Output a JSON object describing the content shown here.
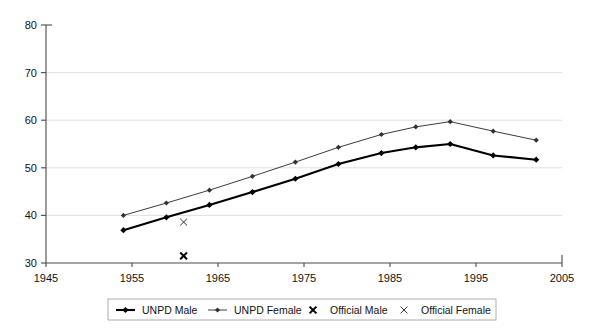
{
  "chart_data": {
    "type": "line",
    "title": "",
    "xlabel": "",
    "ylabel": "",
    "xlim": [
      1945,
      2005
    ],
    "ylim": [
      30,
      80
    ],
    "xticks": [
      1945,
      1955,
      1965,
      1975,
      1985,
      1995,
      2005
    ],
    "yticks": [
      30,
      40,
      50,
      60,
      70,
      80
    ],
    "grid": "horizontal",
    "legend_position": "bottom",
    "x": [
      1954,
      1959,
      1964,
      1969,
      1974,
      1979,
      1984,
      1988,
      1992,
      1997,
      2002
    ],
    "series": [
      {
        "name": "UNPD Male",
        "style": "line-diamond-bold",
        "color": "#000000",
        "values": [
          36.9,
          39.6,
          42.2,
          44.9,
          47.7,
          50.8,
          53.1,
          54.3,
          55.0,
          52.6,
          51.7
        ]
      },
      {
        "name": "UNPD Female",
        "style": "line-diamond-thin",
        "color": "#303030",
        "values": [
          40.0,
          42.6,
          45.3,
          48.2,
          51.2,
          54.3,
          57.0,
          58.6,
          59.7,
          57.7,
          55.8
        ]
      },
      {
        "name": "Official Male",
        "style": "x-marker-bold",
        "color": "#000000",
        "points": [
          {
            "x": 1961,
            "y": 31.5
          }
        ]
      },
      {
        "name": "Official Female",
        "style": "x-marker-thin",
        "color": "#303030",
        "points": [
          {
            "x": 1961,
            "y": 38.6
          }
        ]
      }
    ]
  },
  "axes": {
    "y_tick_labels": [
      "80",
      "70",
      "60",
      "50",
      "40",
      "30"
    ],
    "x_tick_labels": [
      "1945",
      "1955",
      "1965",
      "1975",
      "1985",
      "1995",
      "2005"
    ]
  },
  "legend": {
    "items": [
      {
        "label": "UNPD Male",
        "marker": "line-diamond-bold"
      },
      {
        "label": "UNPD Female",
        "marker": "line-diamond-thin"
      },
      {
        "label": "Official Male",
        "marker": "x-marker-bold"
      },
      {
        "label": "Official Female",
        "marker": "x-marker-thin"
      }
    ]
  },
  "colors": {
    "male": "#000000",
    "female": "#303030",
    "grid": "#d8d8d8",
    "axis": "#4a4a4a",
    "background": "#ffffff"
  }
}
